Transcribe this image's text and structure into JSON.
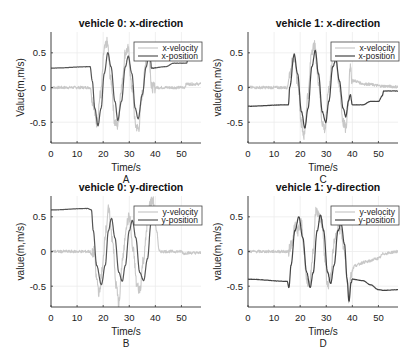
{
  "figure": {
    "width": 418,
    "height": 362
  },
  "chart_data": [
    {
      "id": "A",
      "type": "line",
      "title": "vehicle 0: x-direction",
      "xlabel": "Time/s",
      "ylabel": "Value(m,m/s)",
      "panel_label": "A",
      "xlim": [
        0,
        57.5
      ],
      "ylim": [
        -0.8,
        0.8
      ],
      "xticks": [
        0,
        10,
        20,
        30,
        40,
        50
      ],
      "yticks": [
        -0.5,
        0,
        0.5
      ],
      "ytick_labels": [
        "-0.5",
        "0",
        "0.5"
      ],
      "grid": true,
      "legend": {
        "position": "northeast",
        "entries": [
          "x-velocity",
          "x-position"
        ]
      },
      "series": [
        {
          "name": "x-velocity",
          "color": "#c8c8c8",
          "points": [
            [
              0,
              0
            ],
            [
              15,
              0
            ],
            [
              16,
              -0.2
            ],
            [
              17.5,
              -0.5
            ],
            [
              19,
              -0.1
            ],
            [
              20.5,
              0.55
            ],
            [
              21.5,
              0.65
            ],
            [
              23,
              0.1
            ],
            [
              24.5,
              -0.5
            ],
            [
              25.5,
              -0.55
            ],
            [
              27,
              0
            ],
            [
              28.5,
              0.5
            ],
            [
              29.5,
              0.55
            ],
            [
              31,
              0
            ],
            [
              32.5,
              -0.55
            ],
            [
              33.5,
              -0.6
            ],
            [
              35,
              -0.1
            ],
            [
              36.5,
              0.4
            ],
            [
              37.5,
              0.6
            ],
            [
              38,
              0.3
            ],
            [
              38.5,
              0
            ],
            [
              45,
              0
            ],
            [
              51,
              0
            ],
            [
              52,
              0.05
            ],
            [
              57.5,
              0.05
            ]
          ],
          "noise": 0.08
        },
        {
          "name": "x-position",
          "color": "#555555",
          "points": [
            [
              0,
              0.28
            ],
            [
              15,
              0.3
            ],
            [
              15.8,
              0.1
            ],
            [
              16.8,
              -0.3
            ],
            [
              18,
              -0.55
            ],
            [
              19.2,
              -0.3
            ],
            [
              20.4,
              0.2
            ],
            [
              21.8,
              0.5
            ],
            [
              23,
              0.3
            ],
            [
              24.5,
              -0.2
            ],
            [
              25.6,
              -0.47
            ],
            [
              27,
              -0.2
            ],
            [
              28.5,
              0.3
            ],
            [
              29.6,
              0.45
            ],
            [
              31,
              0.2
            ],
            [
              32.3,
              -0.3
            ],
            [
              33.4,
              -0.45
            ],
            [
              35,
              -0.1
            ],
            [
              36.5,
              0.3
            ],
            [
              37.6,
              0.5
            ],
            [
              38.2,
              0.38
            ],
            [
              38.5,
              0.28
            ],
            [
              44,
              0.3
            ],
            [
              47,
              0.35
            ],
            [
              52,
              0.35
            ],
            [
              53,
              0.6
            ],
            [
              57.5,
              0.6
            ]
          ],
          "noise": 0.005
        }
      ]
    },
    {
      "id": "C",
      "type": "line",
      "title": "vehicle 1: x-direction",
      "xlabel": "Time/s",
      "ylabel": "value(m,m/s)",
      "panel_label": "C",
      "xlim": [
        0,
        57.5
      ],
      "ylim": [
        -0.8,
        0.8
      ],
      "xticks": [
        0,
        10,
        20,
        30,
        40,
        50
      ],
      "yticks": [
        -0.5,
        0,
        0.5
      ],
      "ytick_labels": [
        "-0.5",
        "0",
        "0.5"
      ],
      "grid": true,
      "legend": {
        "position": "northeast",
        "entries": [
          "x-velocity",
          "x-position"
        ]
      },
      "series": [
        {
          "name": "x-velocity",
          "color": "#c8c8c8",
          "points": [
            [
              0,
              0
            ],
            [
              15,
              0
            ],
            [
              16,
              0.2
            ],
            [
              17.5,
              0.45
            ],
            [
              19,
              0.1
            ],
            [
              20.5,
              -0.5
            ],
            [
              21.5,
              -0.7
            ],
            [
              23,
              -0.1
            ],
            [
              24.5,
              0.55
            ],
            [
              25.5,
              0.6
            ],
            [
              27,
              0.1
            ],
            [
              28.5,
              -0.5
            ],
            [
              29.5,
              -0.6
            ],
            [
              31,
              0
            ],
            [
              32.5,
              0.45
            ],
            [
              33.5,
              0.5
            ],
            [
              35,
              0
            ],
            [
              36.5,
              -0.5
            ],
            [
              37.5,
              -0.6
            ],
            [
              38.5,
              -0.2
            ],
            [
              39,
              0.3
            ],
            [
              40,
              0.1
            ],
            [
              45,
              0.05
            ],
            [
              52,
              0.02
            ],
            [
              57.5,
              0.01
            ]
          ],
          "noise": 0.08
        },
        {
          "name": "x-position",
          "color": "#444444",
          "points": [
            [
              0,
              -0.27
            ],
            [
              14.5,
              -0.25
            ],
            [
              15.5,
              -0.25
            ],
            [
              16,
              0
            ],
            [
              17.7,
              0.48
            ],
            [
              19,
              0.2
            ],
            [
              20.5,
              -0.35
            ],
            [
              21.8,
              -0.58
            ],
            [
              23,
              -0.3
            ],
            [
              24.5,
              0.3
            ],
            [
              25.8,
              0.53
            ],
            [
              27,
              0.2
            ],
            [
              28.5,
              -0.35
            ],
            [
              29.8,
              -0.5
            ],
            [
              31,
              -0.2
            ],
            [
              32.5,
              0.3
            ],
            [
              33.7,
              0.4
            ],
            [
              35,
              0.1
            ],
            [
              36.5,
              -0.3
            ],
            [
              37.5,
              -0.42
            ],
            [
              38.5,
              -0.2
            ],
            [
              39.2,
              -0.1
            ],
            [
              40,
              -0.25
            ],
            [
              44,
              -0.25
            ],
            [
              47,
              -0.2
            ],
            [
              50,
              -0.2
            ],
            [
              51.5,
              -0.12
            ],
            [
              52,
              -0.05
            ],
            [
              57.5,
              -0.05
            ]
          ],
          "noise": 0.008
        }
      ]
    },
    {
      "id": "B",
      "type": "line",
      "title": "vehicle 0: y-direction",
      "xlabel": "Time/s",
      "ylabel": "value(m,m/s)",
      "panel_label": "B",
      "xlim": [
        0,
        57.5
      ],
      "ylim": [
        -0.8,
        0.8
      ],
      "xticks": [
        0,
        10,
        20,
        30,
        40,
        50
      ],
      "yticks": [
        -0.5,
        0,
        0.5
      ],
      "ytick_labels": [
        "-0.5",
        "0",
        "0.5"
      ],
      "grid": true,
      "legend": {
        "position": "northeast",
        "entries": [
          "y-velocity",
          "y-position"
        ]
      },
      "series": [
        {
          "name": "y-velocity",
          "color": "#c8c8c8",
          "points": [
            [
              0,
              0
            ],
            [
              15,
              0
            ],
            [
              15.5,
              -0.05
            ],
            [
              16.5,
              0
            ],
            [
              17.5,
              -0.4
            ],
            [
              18.5,
              -0.6
            ],
            [
              19.5,
              -0.3
            ],
            [
              21,
              0.3
            ],
            [
              22,
              0.6
            ],
            [
              23.5,
              0.2
            ],
            [
              25,
              -0.5
            ],
            [
              26,
              -0.75
            ],
            [
              27.5,
              -0.1
            ],
            [
              29,
              0.4
            ],
            [
              30,
              0.5
            ],
            [
              31.5,
              0
            ],
            [
              33,
              -0.5
            ],
            [
              34,
              -0.55
            ],
            [
              35.5,
              -0.1
            ],
            [
              37,
              0.4
            ],
            [
              38,
              0.7
            ],
            [
              39,
              0.75
            ],
            [
              40.5,
              0.3
            ],
            [
              41.5,
              0
            ],
            [
              50,
              0
            ],
            [
              51,
              -0.03
            ],
            [
              52,
              -0.02
            ],
            [
              57.5,
              -0.02
            ]
          ],
          "noise": 0.08
        },
        {
          "name": "y-position",
          "color": "#555555",
          "points": [
            [
              0,
              0.6
            ],
            [
              14,
              0.62
            ],
            [
              15.5,
              0.6
            ],
            [
              16.2,
              0.3
            ],
            [
              17.5,
              -0.2
            ],
            [
              19.3,
              -0.48
            ],
            [
              20.8,
              -0.2
            ],
            [
              22,
              0.3
            ],
            [
              23.2,
              0.48
            ],
            [
              24.5,
              0.2
            ],
            [
              26,
              -0.3
            ],
            [
              27.3,
              -0.43
            ],
            [
              28.5,
              -0.2
            ],
            [
              30,
              0.3
            ],
            [
              31.2,
              0.45
            ],
            [
              32.5,
              0.2
            ],
            [
              34,
              -0.3
            ],
            [
              35.5,
              -0.42
            ],
            [
              37,
              -0.1
            ],
            [
              38.3,
              0.4
            ],
            [
              39.3,
              0.55
            ],
            [
              40.3,
              0.5
            ],
            [
              42,
              0.48
            ],
            [
              57.5,
              0.48
            ]
          ],
          "noise": 0.005
        }
      ]
    },
    {
      "id": "D",
      "type": "line",
      "title": "vehicle 1: y-direction",
      "xlabel": "Time/s",
      "ylabel": "value(m,m/s)",
      "panel_label": "D",
      "xlim": [
        0,
        57.5
      ],
      "ylim": [
        -0.8,
        0.8
      ],
      "xticks": [
        0,
        10,
        20,
        30,
        40,
        50
      ],
      "yticks": [
        -0.5,
        0,
        0.5
      ],
      "ytick_labels": [
        "-0.5",
        "0",
        "0.5"
      ],
      "grid": true,
      "legend": {
        "position": "northeast",
        "entries": [
          "y-velocity",
          "y-position"
        ]
      },
      "series": [
        {
          "name": "y-velocity",
          "color": "#c8c8c8",
          "points": [
            [
              0,
              0
            ],
            [
              15.5,
              0
            ],
            [
              16.5,
              0.1
            ],
            [
              18,
              0.35
            ],
            [
              19,
              0.3
            ],
            [
              20.5,
              0.4
            ],
            [
              21.5,
              0
            ],
            [
              22.5,
              -0.4
            ],
            [
              23.5,
              -0.5
            ],
            [
              25,
              0
            ],
            [
              26,
              0.6
            ],
            [
              27,
              0.5
            ],
            [
              28.5,
              0.4
            ],
            [
              29.5,
              -0.1
            ],
            [
              30.5,
              -0.5
            ],
            [
              31.5,
              -0.4
            ],
            [
              33,
              0.1
            ],
            [
              34.5,
              0.4
            ],
            [
              35.5,
              0.3
            ],
            [
              37,
              0
            ],
            [
              38,
              -0.4
            ],
            [
              38.7,
              -0.7
            ],
            [
              39.5,
              -0.3
            ],
            [
              41,
              -0.2
            ],
            [
              45,
              -0.15
            ],
            [
              50,
              -0.1
            ],
            [
              52,
              -0.03
            ],
            [
              57.5,
              0
            ]
          ],
          "noise": 0.08
        },
        {
          "name": "y-position",
          "color": "#444444",
          "points": [
            [
              0,
              -0.4
            ],
            [
              15,
              -0.43
            ],
            [
              15.7,
              -0.52
            ],
            [
              16.5,
              -0.2
            ],
            [
              18,
              0.3
            ],
            [
              19.5,
              0.5
            ],
            [
              21,
              0.2
            ],
            [
              22.5,
              -0.3
            ],
            [
              23.8,
              -0.52
            ],
            [
              25,
              -0.3
            ],
            [
              26.5,
              0.3
            ],
            [
              27.8,
              0.53
            ],
            [
              29,
              0.3
            ],
            [
              30.5,
              -0.3
            ],
            [
              31.7,
              -0.46
            ],
            [
              33,
              -0.2
            ],
            [
              34.5,
              0.3
            ],
            [
              35.7,
              0.4
            ],
            [
              37,
              0.1
            ],
            [
              38,
              -0.4
            ],
            [
              38.7,
              -0.72
            ],
            [
              39.5,
              -0.45
            ],
            [
              40,
              -0.4
            ],
            [
              44,
              -0.42
            ],
            [
              47,
              -0.48
            ],
            [
              50,
              -0.55
            ],
            [
              52,
              -0.56
            ],
            [
              57.5,
              -0.55
            ]
          ],
          "noise": 0.008
        }
      ]
    }
  ],
  "panels_layout": [
    {
      "id": "A",
      "x0": 51,
      "x1": 201,
      "y_top": 32,
      "y_bot": 143
    },
    {
      "id": "C",
      "x0": 248,
      "x1": 398,
      "y_top": 32,
      "y_bot": 143
    },
    {
      "id": "B",
      "x0": 51,
      "x1": 201,
      "y_top": 196,
      "y_bot": 307
    },
    {
      "id": "D",
      "x0": 248,
      "x1": 398,
      "y_top": 196,
      "y_bot": 307
    }
  ]
}
